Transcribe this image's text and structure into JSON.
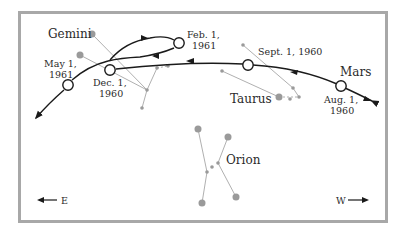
{
  "constellations": {
    "gemini": "Gemini",
    "taurus": "Taurus",
    "orion": "Orion"
  },
  "planet": "Mars",
  "positions": [
    {
      "id": "aug",
      "line1": "Aug. 1,",
      "line2": "1960"
    },
    {
      "id": "sept",
      "line1": "Sept. 1, 1960",
      "line2": ""
    },
    {
      "id": "dec",
      "line1": "Dec. 1,",
      "line2": "1960"
    },
    {
      "id": "feb",
      "line1": "Feb. 1,",
      "line2": "1961"
    },
    {
      "id": "may",
      "line1": "May 1,",
      "line2": "1961"
    }
  ],
  "directions": {
    "east": "E",
    "west": "W"
  },
  "colors": {
    "frame": "#a8a8a8",
    "path": "#1a1a1a",
    "star": "#9a9a9a",
    "star_line": "#b0b0b0",
    "text": "#2a2a2a"
  }
}
